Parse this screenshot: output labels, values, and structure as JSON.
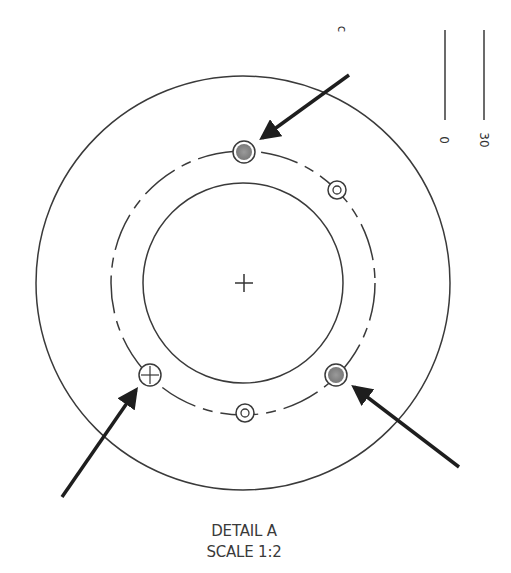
{
  "detail": {
    "title": "DETAIL A",
    "scale": "SCALE 1:2"
  },
  "scale_bar": {
    "label_start": "0",
    "label_end": "30"
  },
  "fragment_text": "c",
  "colors": {
    "line": "#3a3a3a",
    "arrow": "#1e1e1e",
    "hole_fill": "#8c8c8c"
  },
  "geometry": {
    "center": [
      243,
      283
    ],
    "outer_radius": 207,
    "bolt_circle_radius": 132,
    "inner_radius": 100
  },
  "holes": [
    {
      "id": "top",
      "type": "filled",
      "x": 244,
      "y": 152,
      "marked": true
    },
    {
      "id": "right",
      "type": "filled",
      "x": 336,
      "y": 375,
      "marked": true
    },
    {
      "id": "left",
      "type": "crosshair",
      "x": 150,
      "y": 375,
      "marked": true
    },
    {
      "id": "upper-right",
      "type": "concentric",
      "x": 337,
      "y": 190,
      "marked": false
    },
    {
      "id": "bottom",
      "type": "concentric",
      "x": 245,
      "y": 413,
      "marked": false
    }
  ]
}
